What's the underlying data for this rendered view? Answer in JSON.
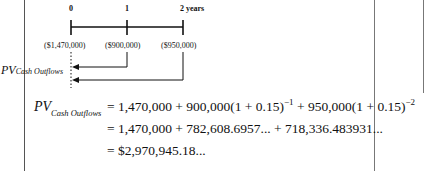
{
  "timeline": {
    "ticks": [
      "0",
      "1",
      "2 years"
    ],
    "cash_flows": [
      "($1,470,000)",
      "($900,000)",
      "($950,000)"
    ],
    "pv_label": "PV",
    "pv_subscript": "Cash Outflows"
  },
  "equation": {
    "lhs": "PV",
    "lhs_subscript": "Cash Outflows",
    "line1_a": "= 1,470,000 + 900,000(1 + 0.15)",
    "line1_exp1": "−1",
    "line1_b": " + 950,000(1 + 0.15)",
    "line1_exp2": "−2",
    "line2": "= 1,470,000 + 782,608.6957... + 718,336.483931...",
    "line3": "= $2,970,945.18..."
  }
}
